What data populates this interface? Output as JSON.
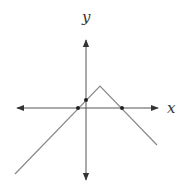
{
  "diagram": {
    "type": "function-graph",
    "axes": {
      "x_label": "x",
      "y_label": "y",
      "origin_px": [
        86,
        108
      ],
      "x_range_px": [
        15,
        160
      ],
      "y_range_px": [
        38,
        182
      ],
      "color": "#444444"
    },
    "graph": {
      "color": "#777777",
      "vertices_px": [
        [
          15,
          174
        ],
        [
          100,
          86
        ],
        [
          157,
          145
        ]
      ]
    },
    "points": [
      {
        "name": "x-intercept-left",
        "px": [
          78,
          108
        ]
      },
      {
        "name": "y-intercept",
        "px": [
          86,
          100
        ]
      },
      {
        "name": "x-intercept-right",
        "px": [
          122,
          108
        ]
      }
    ],
    "point_color": "#222222"
  }
}
